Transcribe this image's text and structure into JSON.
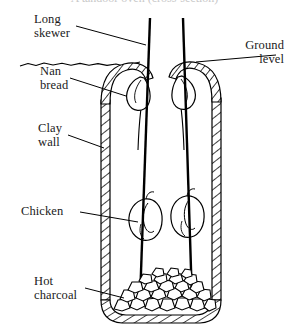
{
  "figure": {
    "title_partial": "A tandoor oven (cross-section)",
    "background_color": "#ffffff",
    "ink_color": "#000000"
  },
  "labels": {
    "long_skewer": {
      "line1": "Long",
      "line2": "skewer"
    },
    "nan_bread": {
      "line1": "Nan",
      "line2": "bread"
    },
    "clay_wall": {
      "line1": "Clay",
      "line2": "wall"
    },
    "chicken": {
      "line1": "Chicken",
      "line2": ""
    },
    "hot_charcoal": {
      "line1": "Hot",
      "line2": "charcoal"
    },
    "ground_level": {
      "line1": "Ground",
      "line2": "level"
    }
  },
  "parts": {
    "skewer_count": 2,
    "nan_bread_count": 2,
    "chicken_count": 2,
    "charcoal_described": "pile of irregular lumps on oven floor",
    "wall_fill": "diagonal hatching",
    "ground_line_style": "wavy"
  }
}
